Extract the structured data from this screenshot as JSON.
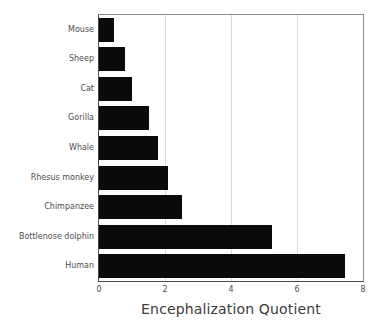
{
  "chart_data": {
    "type": "bar",
    "orientation": "horizontal",
    "title": "",
    "xlabel": "Encephalization Quotient",
    "ylabel": "",
    "xlim": [
      0,
      8
    ],
    "xticks": [
      "0",
      "2",
      "4",
      "6",
      "8"
    ],
    "xtick_values": [
      0,
      2,
      4,
      6,
      8
    ],
    "grid": "vertical",
    "legend": "none",
    "bar_color": "#0a0a0a",
    "axis_color": "#4a4a4a",
    "grid_color": "#d9d9d9",
    "tick_label_color": "#4d4d4d",
    "axis_title_color": "#3b3b3b",
    "categories": [
      "Mouse",
      "Sheep",
      "Cat",
      "Gorilla",
      "Whale",
      "Rhesus monkey",
      "Chimpanzee",
      "Bottlenose dolphin",
      "Human"
    ],
    "values": [
      0.45,
      0.8,
      1.0,
      1.5,
      1.8,
      2.1,
      2.5,
      5.25,
      7.45
    ],
    "bars": [
      {
        "label": "Mouse",
        "value": 0.45
      },
      {
        "label": "Sheep",
        "value": 0.8
      },
      {
        "label": "Cat",
        "value": 1.0
      },
      {
        "label": "Gorilla",
        "value": 1.5
      },
      {
        "label": "Whale",
        "value": 1.8
      },
      {
        "label": "Rhesus monkey",
        "value": 2.1
      },
      {
        "label": "Chimpanzee",
        "value": 2.5
      },
      {
        "label": "Bottlenose dolphin",
        "value": 5.25
      },
      {
        "label": "Human",
        "value": 7.45
      }
    ]
  }
}
